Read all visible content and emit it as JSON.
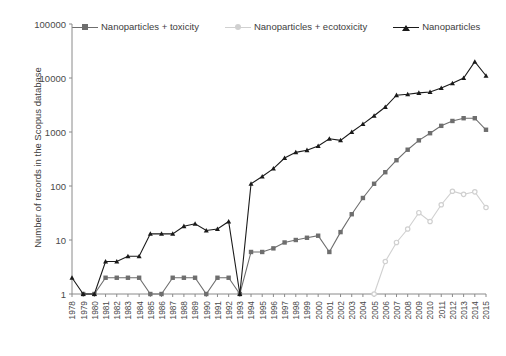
{
  "chart_data": {
    "type": "line",
    "title": "",
    "xlabel": "",
    "ylabel": "Number of records in the Scopus database",
    "yscale": "log",
    "ylim": [
      1,
      100000
    ],
    "ytick_labels": [
      "1",
      "10",
      "100",
      "1000",
      "10000",
      "100000"
    ],
    "ytick_values": [
      1,
      10,
      100,
      1000,
      10000,
      100000
    ],
    "grid": false,
    "legend_position": "top",
    "categories": [
      "1978",
      "1979",
      "1980",
      "1981",
      "1982",
      "1983",
      "1984",
      "1985",
      "1986",
      "1987",
      "1988",
      "1989",
      "1990",
      "1991",
      "1992",
      "1993",
      "1994",
      "1995",
      "1996",
      "1997",
      "1998",
      "1999",
      "2000",
      "2001",
      "2002",
      "2003",
      "2004",
      "2005",
      "2006",
      "2007",
      "2008",
      "2009",
      "2010",
      "2011",
      "2012",
      "2013",
      "2014",
      "2015"
    ],
    "series": [
      {
        "name": "Nanoparticles + toxicity",
        "color": "#6e6e6e",
        "marker": "square",
        "values": [
          null,
          1,
          1,
          2,
          2,
          2,
          2,
          1,
          1,
          2,
          2,
          2,
          1,
          2,
          2,
          1,
          6,
          6,
          7,
          9,
          10,
          11,
          12,
          6,
          14,
          30,
          60,
          110,
          180,
          300,
          470,
          700,
          950,
          1300,
          1600,
          1800,
          1800,
          1100
        ]
      },
      {
        "name": "Nanoparticles + ecotoxicity",
        "color": "#d0d0d0",
        "marker": "circle",
        "values": [
          null,
          null,
          null,
          null,
          null,
          null,
          null,
          null,
          null,
          null,
          null,
          null,
          null,
          null,
          null,
          null,
          null,
          null,
          null,
          null,
          null,
          null,
          null,
          null,
          null,
          null,
          null,
          1,
          4,
          9,
          16,
          32,
          22,
          45,
          80,
          70,
          78,
          40
        ]
      },
      {
        "name": "Nanoparticles",
        "color": "#1a1a1a",
        "marker": "triangle",
        "values": [
          2,
          1,
          1,
          4,
          4,
          5,
          5,
          13,
          13,
          13,
          18,
          20,
          15,
          16,
          22,
          1,
          110,
          150,
          210,
          330,
          420,
          460,
          550,
          750,
          700,
          1000,
          1400,
          2000,
          2900,
          4800,
          5000,
          5300,
          5500,
          6500,
          8000,
          10000,
          13000,
          16000
        ]
      }
    ],
    "series_corrections": {
      "Nanoparticles": [
        2,
        1,
        1,
        4,
        4,
        5,
        5,
        13,
        13,
        13,
        18,
        20,
        15,
        16,
        22,
        1,
        110,
        150,
        210,
        330,
        420,
        460,
        550,
        750,
        700,
        1000,
        1400,
        2000,
        2900,
        4800,
        5000,
        5300,
        5500,
        6500,
        8000,
        10000,
        20000,
        11000
      ]
    }
  },
  "legend": {
    "items": [
      {
        "label": "Nanoparticles + toxicity",
        "color": "#6e6e6e"
      },
      {
        "label": "Nanoparticles + ecotoxicity",
        "color": "#d0d0d0"
      },
      {
        "label": "Nanoparticles",
        "color": "#1a1a1a"
      }
    ]
  }
}
